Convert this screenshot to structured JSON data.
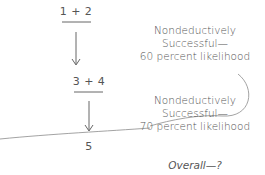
{
  "steps": [
    {
      "label": "1 + 2"
    },
    {
      "label": "3 + 4"
    },
    {
      "label": "5"
    }
  ],
  "annotations": [
    {
      "line1": "Nondeductively",
      "line2": "Successful—",
      "line3": "60 percent likelihood"
    },
    {
      "line1": "Nondeductively",
      "line2": "Successful—",
      "line3": "70 percent likelihood"
    }
  ],
  "overall": "Overall—?",
  "colors": {
    "text": "#555555",
    "lines": "#666666",
    "curve": "#999999"
  }
}
